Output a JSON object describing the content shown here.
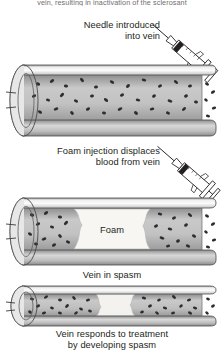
{
  "figure": {
    "clipped_header_text": "vein, resulting in inactivation of the sclerosant",
    "panels": [
      {
        "id": "panel-1",
        "label": "Needle introduced\ninto vein",
        "label_align": "right",
        "label_position": "above",
        "syringe": "syringe-icon",
        "vessel_state": "open vein filled with blood",
        "lumen_content": "blood",
        "has_foam": false
      },
      {
        "id": "panel-2",
        "label": "Foam injection displaces\nblood from vein",
        "label_align": "right",
        "label_position": "above",
        "syringe": "syringe-icon",
        "vessel_state": "vein with foam bolus displacing blood",
        "lumen_content": "blood",
        "has_foam": true,
        "foam_label": "Foam"
      },
      {
        "id": "panel-3",
        "label": "Vein in spasm",
        "label_align": "center",
        "label_position": "above",
        "caption": "Vein responds to treatment\nby developing spasm",
        "vessel_state": "constricted vein in spasm",
        "lumen_content": "blood",
        "has_foam": true,
        "foam_label": ""
      }
    ]
  },
  "colors": {
    "ink": "#231f20",
    "wall_light": "#f2f2f2",
    "wall_mid": "#b9b9b9",
    "wall_dark": "#8a8a8a",
    "lumen_light": "#cfcfcf",
    "lumen_mid": "#a9a9a9",
    "blood_cell": "#2b2b2b",
    "foam_fill": "#f7f6f2",
    "background": "#ffffff",
    "clipped_text": "#6f6d6e"
  }
}
